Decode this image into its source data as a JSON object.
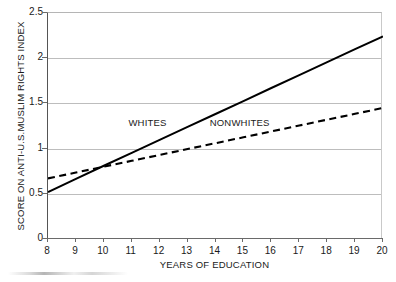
{
  "chart_data": {
    "type": "line",
    "title": "",
    "xlabel": "YEARS OF EDUCATION",
    "ylabel": "SCORE ON ANTI-U.S.MUSLIM RIGHTS INDEX",
    "xlim": [
      8,
      20
    ],
    "ylim": [
      0,
      2.5
    ],
    "grid": true,
    "legend_position": "inline-annotations",
    "x": [
      8,
      9,
      10,
      11,
      12,
      13,
      14,
      15,
      16,
      17,
      18,
      19,
      20
    ],
    "x_tick_labels": [
      "8",
      "9",
      "10",
      "11",
      "12",
      "13",
      "14",
      "15",
      "16",
      "17",
      "18",
      "19",
      "20"
    ],
    "y_ticks": [
      0,
      0.5,
      1,
      1.5,
      2,
      2.5
    ],
    "y_tick_labels": [
      "0",
      "0.5",
      "1",
      "1.5",
      "2",
      "2.5"
    ],
    "series": [
      {
        "name": "WHITES",
        "style": "solid",
        "color": "#000000",
        "values": [
          0.52,
          0.666,
          0.81,
          0.953,
          1.096,
          1.24,
          1.383,
          1.526,
          1.67,
          1.813,
          1.956,
          2.1,
          2.24
        ]
      },
      {
        "name": "NONWHITES",
        "style": "dashed",
        "color": "#000000",
        "values": [
          0.67,
          0.735,
          0.8,
          0.865,
          0.93,
          0.995,
          1.06,
          1.125,
          1.19,
          1.255,
          1.32,
          1.385,
          1.45
        ]
      }
    ],
    "annotations": [
      {
        "text": "WHITES",
        "x": 11.6,
        "y": 1.27
      },
      {
        "text": "NONWHITES",
        "x": 14.9,
        "y": 1.27
      }
    ]
  },
  "colors": {
    "line": "#000000",
    "grid": "#bdbdbd",
    "axis": "#6a6a6a",
    "background": "#ffffff"
  }
}
